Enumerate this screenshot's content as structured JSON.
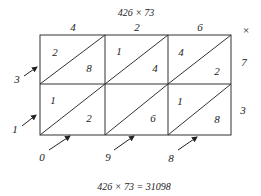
{
  "title": "426 × 73",
  "result": "426 × 73 = 31098",
  "multiplicand_digits": [
    "4",
    "2",
    "6"
  ],
  "multiplier_digits": [
    "7",
    "3"
  ],
  "operator": "×",
  "cells": [
    [
      {
        "tens": "2",
        "ones": "8"
      },
      {
        "tens": "1",
        "ones": "4"
      },
      {
        "tens": "4",
        "ones": "2"
      }
    ],
    [
      {
        "tens": "1",
        "ones": "2"
      },
      {
        "tens": "",
        "ones": "6"
      },
      {
        "tens": "1",
        "ones": "8"
      }
    ]
  ],
  "diagonal_sums_left": [
    "3",
    "1"
  ],
  "diagonal_sums_bottom": [
    "0",
    "9",
    "8"
  ],
  "colors": {
    "line": "#333333",
    "text": "#222222"
  }
}
